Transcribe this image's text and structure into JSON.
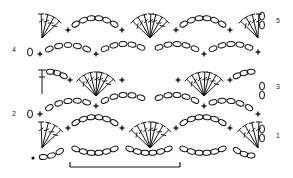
{
  "colors": {
    "ink": "#111111",
    "background": "#ffffff"
  },
  "row_labels": [
    {
      "row": "1",
      "side": "right",
      "x": 276,
      "y": 136
    },
    {
      "row": "2",
      "side": "left",
      "x": 12,
      "y": 114
    },
    {
      "row": "3",
      "side": "right",
      "x": 276,
      "y": 87
    },
    {
      "row": "4",
      "side": "left",
      "x": 12,
      "y": 50
    },
    {
      "row": "5",
      "side": "right",
      "x": 276,
      "y": 21
    }
  ],
  "legend": {
    "chain": "oval",
    "single_crochet": "plus",
    "double_crochet": "T with one bar",
    "slip_stitch": "dot",
    "turning_chain": "stacked ovals"
  },
  "repeat_bracket": {
    "label": "pattern repeat",
    "x1": 70,
    "x2": 180,
    "y": 167
  }
}
